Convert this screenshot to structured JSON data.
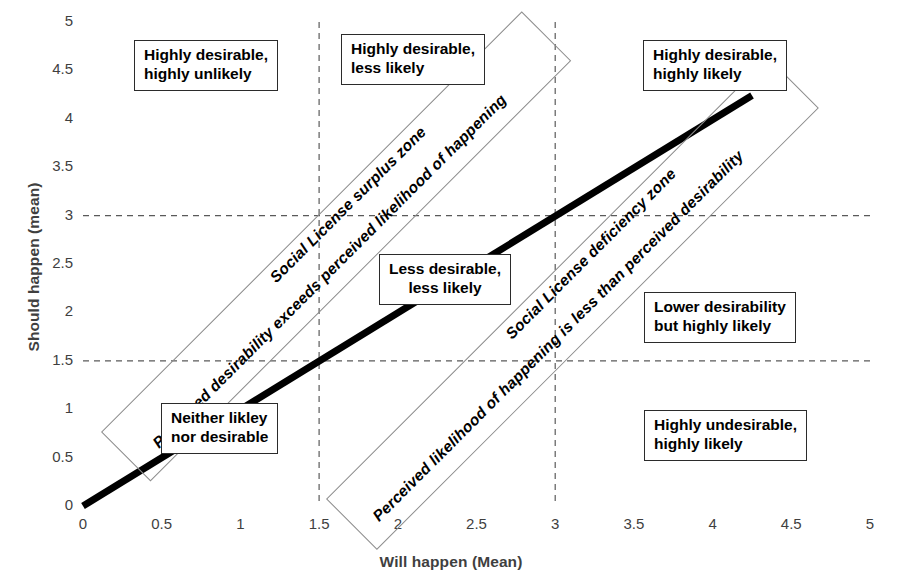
{
  "chart_data": {
    "type": "line",
    "title": "",
    "xlabel": "Will happen (Mean)",
    "ylabel": "Should happen (mean)",
    "xlim": [
      0,
      5
    ],
    "ylim": [
      0,
      5
    ],
    "xticks": [
      "0",
      "0.5",
      "1",
      "1.5",
      "2",
      "2.5",
      "3",
      "3.5",
      "4",
      "4.5",
      "5"
    ],
    "yticks": [
      "0",
      "0.5",
      "1",
      "1.5",
      "2",
      "2.5",
      "3",
      "3.5",
      "4",
      "4.5",
      "5"
    ],
    "grid": "dashed gridlines at x=1.5, x=3 and y=1.5, y=3",
    "gridlines": {
      "x": [
        1.5,
        3
      ],
      "y": [
        1.5,
        3
      ]
    },
    "legend": "none",
    "series": [
      {
        "name": "parity line (should happen = will happen)",
        "type": "line",
        "style": "thick solid black",
        "x": [
          0,
          4.25
        ],
        "y": [
          0,
          4.25
        ]
      }
    ],
    "annotations": [
      {
        "name": "highly-desirable-highly-unlikely",
        "text": "Highly desirable,\nhighly unlikely",
        "x": 0.45,
        "y": 4.6
      },
      {
        "name": "highly-desirable-less-likely",
        "text": "Highly desirable,\nless likely",
        "x": 1.85,
        "y": 4.65
      },
      {
        "name": "highly-desirable-highly-likely",
        "text": "Highly desirable,\nhighly likely",
        "x": 3.95,
        "y": 4.6
      },
      {
        "name": "less-desirable-less-likely",
        "text": "Less desirable,\nless likely",
        "x": 2.1,
        "y": 2.55
      },
      {
        "name": "lower-desirability-but-highly-likely",
        "text": "Lower desirability\nbut highly likely",
        "x": 3.95,
        "y": 2.25
      },
      {
        "name": "highly-undesirable-highly-likely",
        "text": "Highly undesirable,\nhighly likely",
        "x": 3.95,
        "y": 0.75
      },
      {
        "name": "social-license-surplus-zone",
        "text": "Social License surplus zone",
        "subtext": "Perceived desirability exceeds perceived likelihood of happening",
        "rotation": -45
      },
      {
        "name": "social-license-deficiency-zone",
        "text": "Social License deficiency zone",
        "subtext": "Perceived likelihood of happening is less than perceived desirability",
        "rotation": -45
      }
    ],
    "colors": {
      "line": "#000000",
      "grid": "#5a5a5a",
      "band_border": "#8d8d8d",
      "box_border": "#2b2b2b",
      "text": "#000000",
      "axis_text": "#3f3f3f"
    }
  },
  "axes": {
    "y_title": "Should happen (mean)",
    "x_title": "Will happen (Mean)",
    "y_ticks": [
      "5",
      "4.5",
      "4",
      "3.5",
      "3",
      "2.5",
      "2",
      "1.5",
      "1",
      "0.5",
      "0"
    ],
    "x_ticks": [
      "0",
      "0.5",
      "1",
      "1.5",
      "2",
      "2.5",
      "3",
      "3.5",
      "4",
      "4.5",
      "5"
    ]
  },
  "quadrant_boxes": {
    "top_left": {
      "line1": "Highly desirable,",
      "line2": "highly unlikely"
    },
    "top_middle": {
      "line1": "Highly desirable,",
      "line2": "less likely"
    },
    "top_right": {
      "line1": "Highly desirable,",
      "line2": "highly likely"
    },
    "center": {
      "line1": "Less desirable,",
      "line2": "less likely"
    },
    "middle_right": {
      "line1": "Lower desirability",
      "line2": "but highly likely"
    },
    "bottom_right": {
      "line1": "Highly undesirable,",
      "line2": "highly likely"
    },
    "bottom_left": {
      "line1": "Neither likley",
      "line2": "nor desirable"
    }
  },
  "zones": {
    "surplus": {
      "title": "Social License surplus zone",
      "description": "Perceived desirability exceeds perceived likelihood of happening"
    },
    "deficiency": {
      "title": "Social License deficiency zone",
      "description": "Perceived likelihood of happening is less than perceived desirability"
    }
  }
}
